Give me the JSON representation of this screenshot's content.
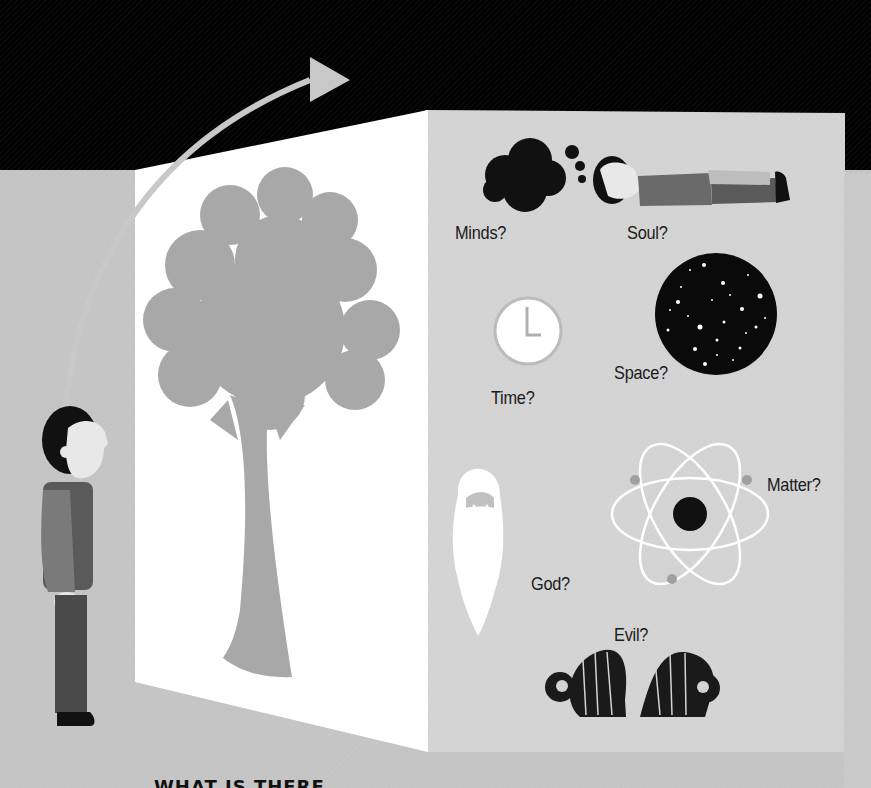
{
  "illustration": {
    "subject": "Person looking past a tree to metaphysical questions behind it",
    "colors": {
      "sky": "#000000",
      "floor": "#c4c4c4",
      "front_panel": "#ffffff",
      "back_panel": "#d2d2d2",
      "tree": "#a8a8a8",
      "arrow": "#c8c8c8",
      "ink": "#111111"
    },
    "labels": {
      "minds": "Minds?",
      "soul": "Soul?",
      "time": "Time?",
      "space": "Space?",
      "god": "God?",
      "matter": "Matter?",
      "evil": "Evil?"
    },
    "icons": [
      "arrow-icon",
      "tree-icon",
      "person-standing-icon",
      "thought-cloud-icon",
      "person-lying-icon",
      "clock-icon",
      "starfield-icon",
      "bearded-face-icon",
      "atom-icon",
      "ram-horns-icon"
    ],
    "footer_text_cropped": "WHAT IS THERE"
  }
}
